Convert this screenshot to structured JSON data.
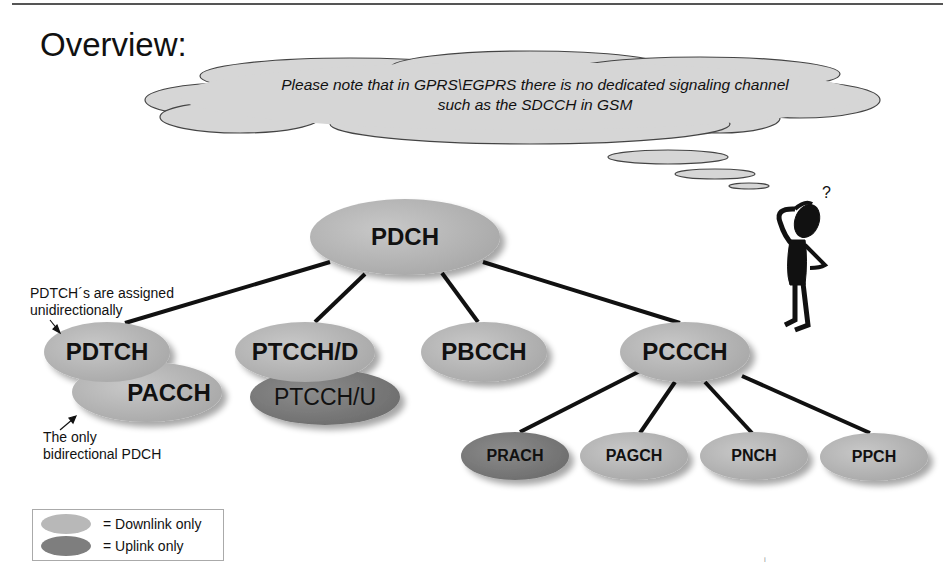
{
  "title": "Overview:",
  "cloud_note": {
    "line1": "Please note that in GPRS\\EGPRS there is no dedicated signaling channel",
    "line2": "such as the SDCCH in GSM"
  },
  "nodes": {
    "root": "PDCH",
    "pdtch": "PDTCH",
    "pacch": "PACCH",
    "ptcch_d": "PTCCH/D",
    "ptcch_u": "PTCCH/U",
    "pbcch": "PBCCH",
    "pccch": "PCCCH",
    "prach": "PRACH",
    "pagch": "PAGCH",
    "pnch": "PNCH",
    "ppch": "PPCH"
  },
  "annotations": {
    "pdtch_line1": "PDTCH´s are assigned",
    "pdtch_line2": "unidirectionally",
    "pacch_line1": "The only",
    "pacch_line2": "bidirectional PDCH"
  },
  "legend": {
    "downlink": "= Downlink only",
    "uplink": "= Uplink only"
  },
  "colors": {
    "downlink": "#b8b8b8",
    "uplink": "#7e7e7e",
    "line": "#111111"
  },
  "footer_mark": "i"
}
